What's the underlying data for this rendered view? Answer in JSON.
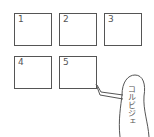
{
  "boxes": [
    {
      "label": "1"
    },
    {
      "label": "2"
    },
    {
      "label": "3"
    },
    {
      "label": "4"
    },
    {
      "label": "5"
    }
  ],
  "figure": {
    "label": "コルビジェ",
    "pointing_at": "5"
  }
}
